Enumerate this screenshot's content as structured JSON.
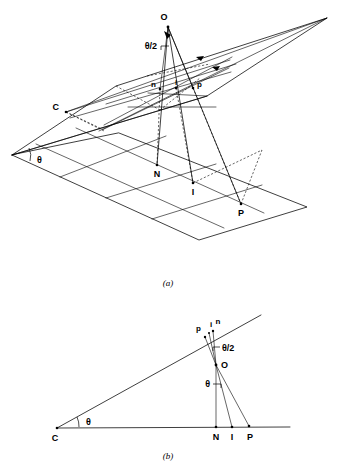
{
  "figure": {
    "type": "geometry-diagram",
    "background_color": "#ffffff",
    "line_color": "#000000",
    "panels": [
      {
        "caption": "(a)",
        "view": "three-dimensional perspective of two intersecting planes",
        "points": [
          {
            "label": "O",
            "role": "apex-source-point"
          },
          {
            "label": "C",
            "role": "point-on-upper-plane-left"
          },
          {
            "label": "n",
            "role": "upper-plane-point-n"
          },
          {
            "label": "i",
            "role": "upper-plane-point-i"
          },
          {
            "label": "p",
            "role": "upper-plane-point-p"
          },
          {
            "label": "N",
            "role": "lower-plane-point-N"
          },
          {
            "label": "I",
            "role": "lower-plane-point-I"
          },
          {
            "label": "P",
            "role": "lower-plane-point-P"
          }
        ],
        "angles": [
          {
            "label": "θ/2",
            "at": "O",
            "role": "half-angle-at-apex"
          },
          {
            "label": "θ",
            "at": "plane-vertex",
            "role": "dihedral-angle-between-planes"
          }
        ]
      },
      {
        "caption": "(b)",
        "view": "two-dimensional side projection",
        "points": [
          {
            "label": "p",
            "role": "upper-line-point-p"
          },
          {
            "label": "i",
            "role": "upper-line-point-i"
          },
          {
            "label": "n",
            "role": "upper-line-point-n"
          },
          {
            "label": "O",
            "role": "source-point"
          },
          {
            "label": "C",
            "role": "apex-of-wedge"
          },
          {
            "label": "N",
            "role": "base-line-point-N"
          },
          {
            "label": "I",
            "role": "base-line-point-I"
          },
          {
            "label": "P",
            "role": "base-line-point-P"
          }
        ],
        "angles": [
          {
            "label": "θ/2",
            "at": "O",
            "role": "half-angle-at-O-upper"
          },
          {
            "label": "θ",
            "at": "O",
            "role": "angle-at-O-lower"
          },
          {
            "label": "θ",
            "at": "C",
            "role": "wedge-opening-angle"
          }
        ]
      }
    ]
  },
  "labels": {
    "a": {
      "O": "O",
      "theta_half": "θ/2",
      "C": "C",
      "n": "n",
      "i": "i",
      "p": "p",
      "theta": "θ",
      "N": "N",
      "I": "I",
      "P": "P",
      "caption": "(a)"
    },
    "b": {
      "p": "p",
      "i": "i",
      "n": "n",
      "theta_half": "θ/2",
      "O": "O",
      "theta_O": "θ",
      "C": "C",
      "theta_C": "θ",
      "N": "N",
      "I": "I",
      "P": "P",
      "caption": "(b)"
    }
  }
}
